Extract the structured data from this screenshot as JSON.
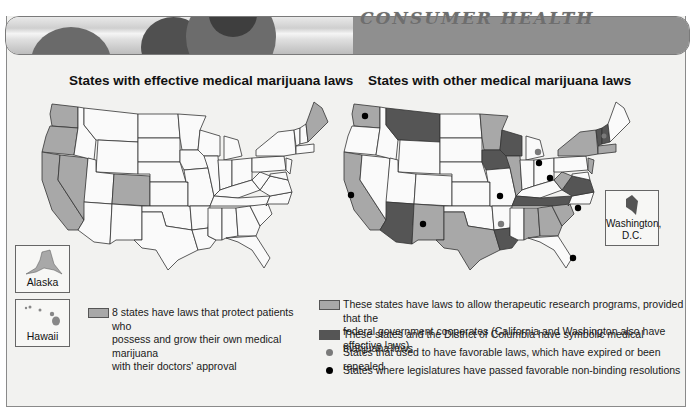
{
  "header": {
    "title": "CONSUMER HEALTH"
  },
  "colors": {
    "light_fill": "#a8a8a8",
    "dark_fill": "#555555",
    "white_fill": "#fafafa",
    "gray_dot": "#7a7a7a",
    "black_dot": "#000000"
  },
  "left_map": {
    "title": "States with effective medical marijuana laws",
    "highlighted_states": [
      "Washington",
      "Oregon",
      "California",
      "Nevada",
      "Colorado",
      "Maine",
      "Alaska",
      "Hawaii"
    ],
    "insets": [
      {
        "label": "Alaska"
      },
      {
        "label": "Hawaii"
      }
    ],
    "legend": {
      "text": "8 states have laws that protect patients who possess and grow their own medical marijuana with their doctors' approval",
      "line1": "8 states have laws that protect patients who",
      "line2": "possess and grow their own medical marijuana",
      "line3": "with their doctors' approval"
    }
  },
  "right_map": {
    "title": "States with other medical marijuana laws",
    "light_states": [
      "Washington",
      "California",
      "New Mexico",
      "Texas",
      "Minnesota",
      "Illinois",
      "New York",
      "New Jersey",
      "West Virginia",
      "Alabama",
      "Georgia",
      "South Carolina",
      "Massachusetts",
      "Rhode Island"
    ],
    "dark_states": [
      "Montana",
      "Arizona",
      "Wisconsin",
      "Iowa",
      "Louisiana",
      "Tennessee",
      "Virginia",
      "Vermont",
      "New Hampshire",
      "District of Columbia"
    ],
    "gray_dot_states": [
      "Michigan",
      "Arkansas",
      "New Hampshire"
    ],
    "black_dot_states": [
      "Washington",
      "California",
      "New Mexico",
      "Missouri",
      "Michigan",
      "Ohio",
      "North Carolina",
      "Florida"
    ],
    "inset": {
      "label_line1": "Washington,",
      "label_line2": "D.C."
    },
    "legend": [
      {
        "type": "light-swatch",
        "line1": "These states have laws to allow therapeutic research programs, provided that the",
        "line2": "federal government cooperates (California and Washington also have effective laws)"
      },
      {
        "type": "dark-swatch",
        "line1": "These states and the District of Columbia have symbolic medical marijuana laws"
      },
      {
        "type": "gray-dot",
        "line1": "States that used to have favorable laws, which have expired or been repealed"
      },
      {
        "type": "black-dot",
        "line1": "States where legislatures have passed favorable non-binding resolutions"
      }
    ]
  }
}
